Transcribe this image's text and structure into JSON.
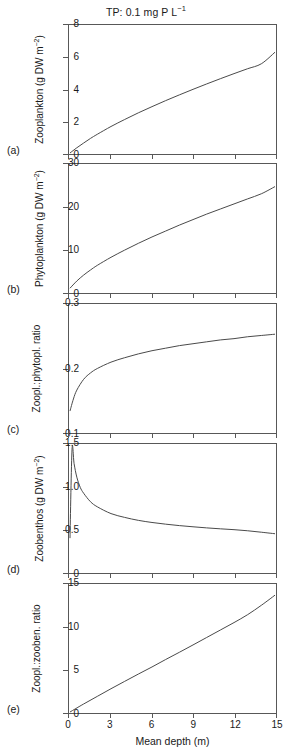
{
  "figure": {
    "title": "TP: 0.1 mg P L",
    "title_sup": "−1",
    "xaxis": {
      "label": "Mean depth (m)",
      "ticks": [
        "0",
        "3",
        "6",
        "9",
        "12",
        "15"
      ],
      "min": 0,
      "max": 15
    },
    "panels": [
      {
        "tag": "(a)",
        "ylabel": "Zooplankton (g DW m",
        "ylabel_sup": "−2",
        "ylabel_tail": ")",
        "yticks": [
          "0",
          "2",
          "4",
          "6",
          "8"
        ],
        "ymin": 0,
        "ymax": 8
      },
      {
        "tag": "(b)",
        "ylabel": "Phytoplankton (g DW m",
        "ylabel_sup": "−2",
        "ylabel_tail": ")",
        "yticks": [
          "0",
          "10",
          "20",
          "30"
        ],
        "ymin": 0,
        "ymax": 30
      },
      {
        "tag": "(c)",
        "ylabel": "Zoopl.:phytopl. ratio",
        "ylabel_sup": "",
        "ylabel_tail": "",
        "yticks": [
          "0.1",
          "0.2",
          "0.3"
        ],
        "ymin": 0.1,
        "ymax": 0.3
      },
      {
        "tag": "(d)",
        "ylabel": "Zoobenthos (g DW m",
        "ylabel_sup": "−2",
        "ylabel_tail": ")",
        "yticks": [
          "0",
          "0.5",
          "1.0",
          "1.5"
        ],
        "ymin": 0,
        "ymax": 1.5
      },
      {
        "tag": "(e)",
        "ylabel": "Zoopl.:zooben. ratio",
        "ylabel_sup": "",
        "ylabel_tail": "",
        "yticks": [
          "0",
          "5",
          "10",
          "15"
        ],
        "ymin": 0,
        "ymax": 15
      }
    ]
  },
  "chart_data": [
    {
      "type": "line",
      "title": "Zooplankton vs mean depth",
      "xlabel": "Mean depth (m)",
      "ylabel": "Zooplankton (g DW m−2)",
      "xlim": [
        0,
        15
      ],
      "ylim": [
        0,
        8
      ],
      "grid": false,
      "legend": "none",
      "x": [
        0,
        0.5,
        1,
        1.5,
        2,
        3,
        4,
        5,
        6,
        7,
        8,
        9,
        10,
        11,
        12,
        13,
        14,
        15
      ],
      "y": [
        0.0,
        0.33,
        0.63,
        0.92,
        1.18,
        1.67,
        2.11,
        2.53,
        2.92,
        3.3,
        3.66,
        4.01,
        4.35,
        4.68,
        5.0,
        5.31,
        5.62,
        6.35
      ]
    },
    {
      "type": "line",
      "title": "Phytoplankton vs mean depth",
      "xlabel": "Mean depth (m)",
      "ylabel": "Phytoplankton (g DW m−2)",
      "xlim": [
        0,
        15
      ],
      "ylim": [
        0,
        30
      ],
      "grid": false,
      "legend": "none",
      "x": [
        0,
        0.5,
        1,
        1.5,
        2,
        3,
        4,
        5,
        6,
        7,
        8,
        9,
        10,
        11,
        12,
        13,
        14,
        15
      ],
      "y": [
        0.9,
        2.6,
        4.0,
        5.2,
        6.3,
        8.2,
        9.9,
        11.5,
        13.0,
        14.4,
        15.8,
        17.1,
        18.4,
        19.6,
        20.8,
        22.0,
        23.2,
        24.9
      ]
    },
    {
      "type": "line",
      "title": "Zoopl.:phytopl. ratio vs mean depth",
      "xlabel": "Mean depth (m)",
      "ylabel": "Zoopl.:phytopl. ratio",
      "xlim": [
        0,
        15
      ],
      "ylim": [
        0.1,
        0.3
      ],
      "grid": false,
      "legend": "none",
      "x": [
        0,
        0.25,
        0.5,
        1,
        1.5,
        2,
        3,
        4,
        5,
        6,
        7,
        8,
        9,
        10,
        11,
        12,
        13,
        14,
        15
      ],
      "y": [
        0.133,
        0.152,
        0.166,
        0.183,
        0.193,
        0.2,
        0.21,
        0.217,
        0.223,
        0.228,
        0.232,
        0.236,
        0.239,
        0.242,
        0.245,
        0.247,
        0.25,
        0.252,
        0.254
      ]
    },
    {
      "type": "line",
      "title": "Zoobenthos vs mean depth",
      "xlabel": "Mean depth (m)",
      "ylabel": "Zoobenthos (g DW m−2)",
      "xlim": [
        0,
        15
      ],
      "ylim": [
        0,
        1.5
      ],
      "grid": false,
      "legend": "none",
      "x": [
        0,
        0.15,
        0.3,
        0.5,
        0.75,
        1,
        1.5,
        2,
        3,
        4,
        5,
        6,
        7,
        8,
        9,
        10,
        11,
        12,
        13,
        14,
        15
      ],
      "y": [
        0.4,
        1.45,
        1.28,
        1.12,
        1.0,
        0.93,
        0.83,
        0.77,
        0.69,
        0.645,
        0.61,
        0.585,
        0.565,
        0.548,
        0.534,
        0.521,
        0.51,
        0.5,
        0.487,
        0.47,
        0.452
      ]
    },
    {
      "type": "line",
      "title": "Zoopl.:zooben. ratio vs mean depth",
      "xlabel": "Mean depth (m)",
      "ylabel": "Zoopl.:zooben. ratio",
      "xlim": [
        0,
        15
      ],
      "ylim": [
        0,
        15
      ],
      "grid": false,
      "legend": "none",
      "x": [
        0,
        1,
        2,
        3,
        4,
        5,
        6,
        7,
        8,
        9,
        10,
        11,
        12,
        13,
        14,
        15
      ],
      "y": [
        0.0,
        0.95,
        1.85,
        2.75,
        3.62,
        4.48,
        5.32,
        6.2,
        7.05,
        7.92,
        8.8,
        9.68,
        10.56,
        11.5,
        12.6,
        13.8
      ]
    }
  ]
}
